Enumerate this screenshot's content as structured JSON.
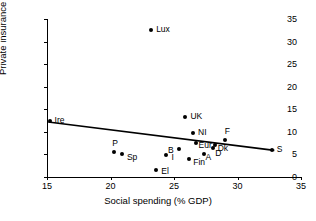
{
  "chart_data": {
    "type": "scatter",
    "title": "",
    "xlabel": "Social spending (% GDP)",
    "ylabel": "Private insurance (% GDP)",
    "xlim": [
      15,
      35
    ],
    "ylim": [
      0,
      35
    ],
    "xticks": [
      15,
      20,
      25,
      30,
      35
    ],
    "yticks": [
      0,
      5,
      10,
      15,
      20,
      25,
      30,
      35
    ],
    "xtick_labels": [
      "15",
      "20",
      "25",
      "30",
      "35"
    ],
    "ytick_labels": [
      "0",
      "5",
      "10",
      "15",
      "20",
      "25",
      "30",
      "35"
    ],
    "grid": false,
    "legend": "none",
    "marker": "filled-diamond",
    "marker_color": "#000000",
    "points": [
      {
        "label": "Ire",
        "x": 15.2,
        "y": 12.3,
        "label_dx": 5,
        "label_dy": -1
      },
      {
        "label": "P",
        "x": 20.3,
        "y": 5.6,
        "label_dx": -2,
        "label_dy": -9
      },
      {
        "label": "Sp",
        "x": 20.9,
        "y": 5.1,
        "label_dx": 5,
        "label_dy": 3
      },
      {
        "label": "Lux",
        "x": 23.2,
        "y": 32.5,
        "label_dx": 5,
        "label_dy": -1
      },
      {
        "label": "El",
        "x": 23.6,
        "y": 1.6,
        "label_dx": 5,
        "label_dy": 1
      },
      {
        "label": "I",
        "x": 24.4,
        "y": 4.8,
        "label_dx": 5,
        "label_dy": 2
      },
      {
        "label": "B",
        "x": 25.4,
        "y": 6.3,
        "label_dx": -11,
        "label_dy": 1
      },
      {
        "label": "UK",
        "x": 25.9,
        "y": 13.3,
        "label_dx": 5,
        "label_dy": -1
      },
      {
        "label": "Fin",
        "x": 26.2,
        "y": 4.0,
        "label_dx": 4,
        "label_dy": 3
      },
      {
        "label": "NI",
        "x": 26.5,
        "y": 9.7,
        "label_dx": 5,
        "label_dy": -1
      },
      {
        "label": "Eur",
        "x": 26.7,
        "y": 7.6,
        "label_dx": 3,
        "label_dy": 2
      },
      {
        "label": "A",
        "x": 27.4,
        "y": 5.2,
        "label_dx": 1,
        "label_dy": 3
      },
      {
        "label": "D",
        "x": 28.1,
        "y": 6.4,
        "label_dx": 2,
        "label_dy": 5
      },
      {
        "label": "Dk",
        "x": 28.2,
        "y": 7.0,
        "label_dx": 3,
        "label_dy": 3
      },
      {
        "label": "F",
        "x": 29.0,
        "y": 8.3,
        "label_dx": 0,
        "label_dy": -9
      },
      {
        "label": "S",
        "x": 32.7,
        "y": 6.0,
        "label_dx": 5,
        "label_dy": -1
      }
    ],
    "trendline": {
      "type": "linear-fit",
      "x0": 15.1,
      "y0": 12.2,
      "x1": 32.9,
      "y1": 5.9,
      "color": "#000000",
      "width": 1.6
    }
  }
}
